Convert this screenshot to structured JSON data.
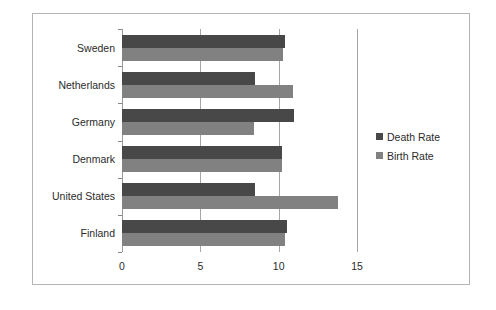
{
  "chart_data": {
    "type": "bar",
    "orientation": "horizontal",
    "title": "",
    "xlabel": "",
    "ylabel": "",
    "categories": [
      "Sweden",
      "Netherlands",
      "Germany",
      "Denmark",
      "United States",
      "Finland"
    ],
    "series": [
      {
        "name": "Death Rate",
        "color": "#484848",
        "values": [
          10.4,
          8.5,
          11.0,
          10.2,
          8.5,
          10.5
        ]
      },
      {
        "name": "Birth Rate",
        "color": "#818181",
        "values": [
          10.3,
          10.9,
          8.4,
          10.2,
          13.8,
          10.4
        ]
      }
    ],
    "xlim": [
      0,
      15
    ],
    "xticks": [
      0,
      5,
      10,
      15
    ],
    "xtick_labels": [
      "0",
      "5",
      "10",
      "15"
    ],
    "grid": true,
    "grid_axis": "x",
    "legend_position": "right",
    "legend_entries": [
      "Death Rate",
      "Birth Rate"
    ],
    "frame_border_color": "#b4b4b4",
    "background_color": "#ffffff"
  }
}
